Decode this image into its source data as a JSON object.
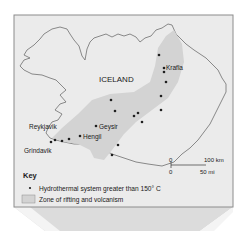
{
  "map": {
    "country_label": "ICELAND",
    "colors": {
      "panel_bg": "#ebebeb",
      "panel_border": "#8c8c8c",
      "land": "#ebebeb",
      "coast": "#6e6e6e",
      "rift_zone": "#d3d3d3",
      "dot": "#1f1f1f",
      "text": "#1a1a1a",
      "curl": "#cfcfcf"
    },
    "places": [
      {
        "id": "krafla",
        "name": "Krafla"
      },
      {
        "id": "geysir",
        "name": "Geysir"
      },
      {
        "id": "hengil",
        "name": "Hengil"
      },
      {
        "id": "reykjavik",
        "name": "Reykjavik"
      },
      {
        "id": "grindavik",
        "name": "Grindavik"
      }
    ],
    "hydrothermal_system_count": 18,
    "scale_bar": {
      "km_zero": "0",
      "km_value": "100 km",
      "mi_zero": "0",
      "mi_value": "50 mi"
    }
  },
  "key": {
    "title": "Key",
    "items": [
      {
        "symbol": "dot",
        "label": "Hydrothermal system greater than 150° C"
      },
      {
        "symbol": "shaded-box",
        "label": "Zone of rifting and volcanism"
      }
    ]
  }
}
